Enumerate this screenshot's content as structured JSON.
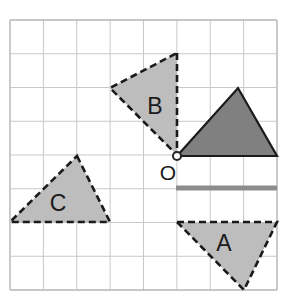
{
  "figure": {
    "background_color": "#ffffff",
    "width": 287,
    "height": 303
  },
  "grid": {
    "name": "square-grid",
    "line_color": "#c8c8cc",
    "border_color": "#b4b4b8",
    "columns": 8,
    "rows": 8,
    "left": 10,
    "top": 20,
    "right": 277,
    "bottom": 290,
    "cell_width": 33.375,
    "cell_height": 33.75
  },
  "origin": {
    "label": "O",
    "x": 177,
    "y": 156,
    "label_x": 168,
    "label_y": 180,
    "marker_radius": 4,
    "marker_fill": "#ffffff",
    "marker_stroke": "#262626"
  },
  "colors": {
    "light_fill": "#bdbdbd",
    "dark_fill": "#808080",
    "outline_dark": "#1a1a1a",
    "bar_gray": "#8c8c8c"
  },
  "shapes": [
    {
      "id": "triangle-dark",
      "label": "",
      "style": "solid",
      "fill": "#808080",
      "stroke": "#1a1a1a",
      "points": "177,156 238,88 277,156",
      "label_x": 0,
      "label_y": 0
    },
    {
      "id": "triangle-b",
      "label": "B",
      "style": "dashed",
      "fill": "#bdbdbd",
      "stroke": "#1a1a1a",
      "points": "177,53 177,155 110,88",
      "label_x": 155,
      "label_y": 114
    },
    {
      "id": "triangle-c",
      "label": "C",
      "style": "dashed",
      "fill": "#bdbdbd",
      "stroke": "#1a1a1a",
      "points": "77,156 110,222 10,222",
      "label_x": 58,
      "label_y": 211
    },
    {
      "id": "triangle-a",
      "label": "A",
      "style": "dashed",
      "fill": "#bdbdbd",
      "stroke": "#1a1a1a",
      "points": "177,222 277,222 244,290",
      "label_x": 224,
      "label_y": 251
    }
  ],
  "segment_bar": {
    "id": "gray-segment",
    "x1": 176,
    "y1": 188,
    "x2": 277,
    "y2": 188,
    "color": "#8c8c8c",
    "thickness": 5
  },
  "labels": {
    "a": "A",
    "b": "B",
    "c": "C",
    "o": "O",
    "font_size": 23,
    "origin_font_size": 21
  }
}
